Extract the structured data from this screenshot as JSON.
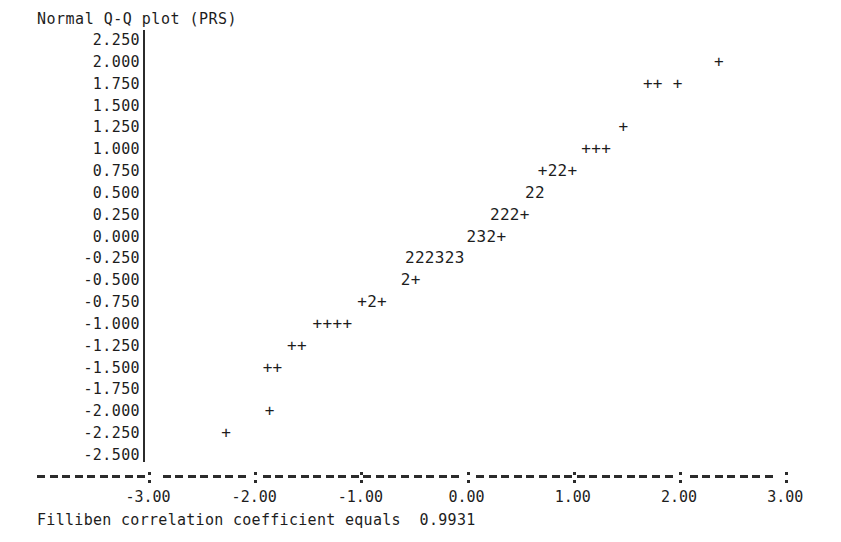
{
  "title": "Normal Q-Q plot (PRS)",
  "caption": "Filliben correlation coefficient equals  0.9931",
  "chart_data": {
    "type": "scatter",
    "title": "Normal Q-Q plot (PRS)",
    "subtitle": "",
    "xlabel": "",
    "ylabel": "",
    "annotations": [
      "Filliben correlation coefficient equals  0.9931"
    ],
    "filliben_correlation_coefficient": 0.9931,
    "grid": false,
    "legend": null,
    "xlim": [
      -3.0,
      3.0
    ],
    "ylim": [
      -2.5,
      2.25
    ],
    "xticks": [
      -3.0,
      -2.0,
      -1.0,
      0.0,
      1.0,
      2.0,
      3.0
    ],
    "xticklabels": [
      "-3.00",
      "-2.00",
      "-1.00",
      "0.00",
      "1.00",
      "2.00",
      "3.00"
    ],
    "yticks": [
      2.25,
      2.0,
      1.75,
      1.5,
      1.25,
      1.0,
      0.75,
      0.5,
      0.25,
      0.0,
      -0.25,
      -0.5,
      -0.75,
      -1.0,
      -1.25,
      -1.5,
      -1.75,
      -2.0,
      -2.25,
      -2.5
    ],
    "yticklabels": [
      "2.250",
      "2.000",
      "1.750",
      "1.500",
      "1.250",
      "1.000",
      "0.750",
      "0.500",
      "0.250",
      "0.000",
      "-0.250",
      "-0.500",
      "-0.750",
      "-1.000",
      "-1.250",
      "-1.500",
      "-1.750",
      "-2.000",
      "-2.250",
      "-2.500"
    ],
    "marker_glyphs": {
      "+": "one observation at this cell",
      "2": "two observations overplotted",
      "3": "three observations overplotted"
    },
    "cells": [
      {
        "glyph": "+",
        "x": -2.32,
        "y": -2.25
      },
      {
        "glyph": "+",
        "x": -1.91,
        "y": -2.0
      },
      {
        "glyph": "+",
        "x": -1.54,
        "y": -1.5
      },
      {
        "glyph": "+",
        "x": -1.42,
        "y": -1.5
      },
      {
        "glyph": "+",
        "x": -1.32,
        "y": -1.25
      },
      {
        "glyph": "+",
        "x": -1.21,
        "y": -1.25
      },
      {
        "glyph": "+",
        "x": -1.1,
        "y": -1.0
      },
      {
        "glyph": "+",
        "x": -1.0,
        "y": -1.0
      },
      {
        "glyph": "+",
        "x": -0.89,
        "y": -1.0
      },
      {
        "glyph": "+",
        "x": -0.78,
        "y": -1.0
      },
      {
        "glyph": "+",
        "x": -0.68,
        "y": -0.75
      },
      {
        "glyph": "2",
        "x": -0.57,
        "y": -0.75
      },
      {
        "glyph": "+",
        "x": -0.47,
        "y": -0.75
      },
      {
        "glyph": "2",
        "x": -0.36,
        "y": -0.5
      },
      {
        "glyph": "+",
        "x": -0.26,
        "y": -0.5
      },
      {
        "glyph": "2",
        "x": -0.15,
        "y": -0.25
      },
      {
        "glyph": "2",
        "x": -0.04,
        "y": -0.25
      },
      {
        "glyph": "2",
        "x": 0.06,
        "y": -0.25
      },
      {
        "glyph": "3",
        "x": 0.17,
        "y": -0.25
      },
      {
        "glyph": "2",
        "x": 0.27,
        "y": -0.25
      },
      {
        "glyph": "3",
        "x": 0.38,
        "y": -0.25
      },
      {
        "glyph": "2",
        "x": 0.49,
        "y": 0.0
      },
      {
        "glyph": "3",
        "x": 0.59,
        "y": 0.0
      },
      {
        "glyph": "2",
        "x": 0.7,
        "y": 0.0
      },
      {
        "glyph": "+",
        "x": 0.8,
        "y": 0.0
      },
      {
        "glyph": "2",
        "x": 0.91,
        "y": 0.25
      },
      {
        "glyph": "2",
        "x": 1.01,
        "y": 0.25
      },
      {
        "glyph": "2",
        "x": 1.12,
        "y": 0.25
      },
      {
        "glyph": "+",
        "x": 1.22,
        "y": 0.25
      },
      {
        "glyph": "2",
        "x": 1.33,
        "y": 0.5
      },
      {
        "glyph": "2",
        "x": 1.43,
        "y": 0.5
      },
      {
        "glyph": "+",
        "x": 1.54,
        "y": 0.75
      },
      {
        "glyph": "2",
        "x": 1.64,
        "y": 0.75
      },
      {
        "glyph": "2",
        "x": 1.75,
        "y": 0.75
      },
      {
        "glyph": "+",
        "x": 1.85,
        "y": 0.75
      },
      {
        "glyph": "+",
        "x": 1.96,
        "y": 1.0
      },
      {
        "glyph": "+",
        "x": 2.06,
        "y": 1.0
      },
      {
        "glyph": "+",
        "x": 2.17,
        "y": 1.0
      },
      {
        "glyph": "+",
        "x": 2.32,
        "y": 1.25
      },
      {
        "glyph": "+",
        "x": 2.53,
        "y": 1.75
      },
      {
        "glyph": "+",
        "x": 2.64,
        "y": 1.75
      },
      {
        "glyph": "+",
        "x": 2.85,
        "y": 1.75
      },
      {
        "glyph": "+",
        "x": 3.17,
        "y": 2.0
      }
    ],
    "rows": [
      {
        "y": 2.0,
        "x_start": 2.33,
        "text": "+"
      },
      {
        "y": 1.75,
        "x_start": 1.66,
        "text": "++ +"
      },
      {
        "y": 1.25,
        "x_start": 1.43,
        "text": "+"
      },
      {
        "y": 1.0,
        "x_start": 1.08,
        "text": "+++"
      },
      {
        "y": 0.75,
        "x_start": 0.67,
        "text": "+22+"
      },
      {
        "y": 0.5,
        "x_start": 0.55,
        "text": "22"
      },
      {
        "y": 0.25,
        "x_start": 0.22,
        "text": "222+"
      },
      {
        "y": 0.0,
        "x_start": 0.0,
        "text": "232+"
      },
      {
        "y": -0.25,
        "x_start": -0.58,
        "text": "222323"
      },
      {
        "y": -0.5,
        "x_start": -0.62,
        "text": "2+"
      },
      {
        "y": -0.75,
        "x_start": -1.03,
        "text": "+2+"
      },
      {
        "y": -1.0,
        "x_start": -1.45,
        "text": "++++"
      },
      {
        "y": -1.25,
        "x_start": -1.69,
        "text": "++"
      },
      {
        "y": -1.5,
        "x_start": -1.92,
        "text": "++"
      },
      {
        "y": -2.0,
        "x_start": -1.9,
        "text": "+"
      },
      {
        "y": -2.25,
        "x_start": -2.31,
        "text": "+"
      }
    ]
  },
  "geometry": {
    "x_axis_px": {
      "x_at_minus3": 148,
      "px_per_unit": 106.2
    },
    "y_axis_px": {
      "y_at_2p25": 40,
      "px_per_quarter": 21.84
    },
    "vaxis_x": 143,
    "char_width": 12.6
  },
  "colors": {
    "ink": "#1d1d1d",
    "axis": "#2b2b2b",
    "background": "#ffffff"
  }
}
